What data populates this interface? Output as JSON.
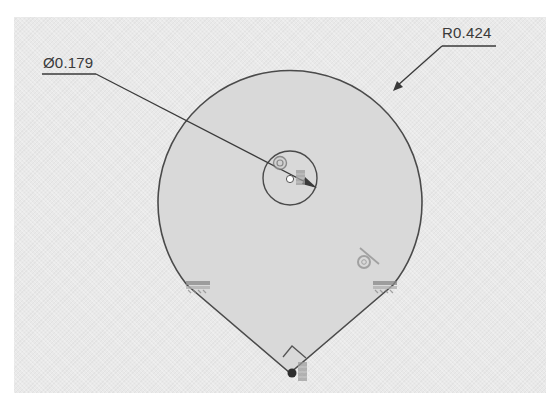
{
  "viewport": {
    "background": "#e9e9e9",
    "sketch_fill": "#d9d9d9",
    "line_color": "#4a4a4a"
  },
  "dimensions": {
    "diameter": {
      "label": "Ø0.179",
      "target": "inner-circle"
    },
    "radius": {
      "label": "R0.424",
      "target": "outer-arc"
    }
  },
  "geometry": {
    "outer_arc": {
      "cx": 290,
      "cy": 178,
      "r": 132
    },
    "inner_circle": {
      "cx": 290,
      "cy": 178,
      "r": 27
    },
    "bottom_vertex": {
      "x": 290,
      "y": 373
    }
  },
  "constraints": [
    {
      "type": "concentric",
      "icon": "concentric-icon",
      "location": "center"
    },
    {
      "type": "fix",
      "icon": "fix-icon",
      "location": "center"
    },
    {
      "type": "tangent",
      "icon": "tangent-icon",
      "location": "right-arc"
    },
    {
      "type": "horizontal-ground",
      "icon": "ground-icon",
      "location": "left-tangent"
    },
    {
      "type": "horizontal-ground",
      "icon": "ground-icon",
      "location": "right-tangent"
    },
    {
      "type": "perpendicular",
      "icon": "perpendicular-icon",
      "location": "bottom-vertex"
    },
    {
      "type": "coincident",
      "icon": "coincident-icon",
      "location": "bottom-vertex"
    },
    {
      "type": "fix",
      "icon": "fix-icon",
      "location": "bottom-vertex"
    }
  ]
}
